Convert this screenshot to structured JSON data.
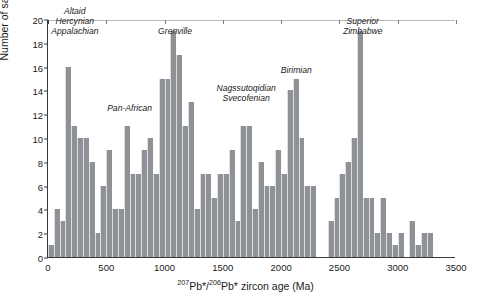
{
  "chart_data": {
    "type": "bar",
    "title": "",
    "xlabel": "207Pb*/206Pb* zircon age (Ma)",
    "ylabel": "Number of samples",
    "xlim": [
      0,
      3500
    ],
    "ylim": [
      0,
      20
    ],
    "xticks": [
      0,
      500,
      1000,
      1500,
      2000,
      2500,
      3000,
      3500
    ],
    "yticks": [
      0,
      2,
      4,
      6,
      8,
      10,
      12,
      14,
      16,
      18,
      20
    ],
    "bin_width": 50,
    "grid": false,
    "legend": null,
    "bar_color": "#8e9195",
    "categories": [
      "0-50",
      "50-100",
      "100-150",
      "150-200",
      "200-250",
      "250-300",
      "300-350",
      "350-400",
      "400-450",
      "450-500",
      "500-550",
      "550-600",
      "600-650",
      "650-700",
      "700-750",
      "750-800",
      "800-850",
      "850-900",
      "900-950",
      "950-1000",
      "1000-1050",
      "1050-1100",
      "1100-1150",
      "1150-1200",
      "1200-1250",
      "1250-1300",
      "1300-1350",
      "1350-1400",
      "1400-1450",
      "1450-1500",
      "1500-1550",
      "1550-1600",
      "1600-1650",
      "1650-1700",
      "1700-1750",
      "1750-1800",
      "1800-1850",
      "1850-1900",
      "1900-1950",
      "1950-2000",
      "2000-2050",
      "2050-2100",
      "2100-2150",
      "2150-2200",
      "2200-2250",
      "2250-2300",
      "2300-2350",
      "2350-2400",
      "2400-2450",
      "2450-2500",
      "2500-2550",
      "2550-2600",
      "2600-2650",
      "2650-2700",
      "2700-2750",
      "2750-2800",
      "2800-2850",
      "2850-2900",
      "2900-2950",
      "2950-3000",
      "3000-3050",
      "3050-3100",
      "3100-3150",
      "3150-3200",
      "3200-3250",
      "3250-3300",
      "3300-3350",
      "3350-3400",
      "3400-3450",
      "3450-3500"
    ],
    "values": [
      1,
      4,
      3,
      16,
      11,
      10,
      10,
      8,
      2,
      6,
      9,
      4,
      4,
      11,
      7,
      7,
      9,
      10,
      7,
      15,
      15,
      19,
      17,
      11,
      13,
      4,
      7,
      7,
      5,
      7,
      7,
      9,
      3,
      11,
      11,
      4,
      8,
      6,
      6,
      9,
      7,
      14,
      15,
      10,
      6,
      6,
      0,
      0,
      3,
      5,
      7,
      8,
      10,
      19,
      5,
      5,
      2,
      5,
      2,
      1,
      2,
      0,
      3,
      1,
      2,
      2,
      0,
      0,
      0,
      0
    ],
    "x_centers": [
      25,
      75,
      125,
      175,
      225,
      275,
      325,
      375,
      425,
      475,
      525,
      575,
      625,
      675,
      725,
      775,
      825,
      875,
      925,
      975,
      1025,
      1075,
      1125,
      1175,
      1225,
      1275,
      1325,
      1375,
      1425,
      1475,
      1525,
      1575,
      1625,
      1675,
      1725,
      1775,
      1825,
      1875,
      1925,
      1975,
      2025,
      2075,
      2125,
      2175,
      2225,
      2275,
      2325,
      2375,
      2425,
      2475,
      2525,
      2575,
      2625,
      2675,
      2725,
      2775,
      2825,
      2875,
      2925,
      2975,
      3025,
      3075,
      3125,
      3175,
      3225,
      3275,
      3325,
      3375,
      3425,
      3475
    ],
    "annotations": [
      {
        "text": "Altaid\nHercynian\nAppalachian",
        "age": 230,
        "count": 18.6
      },
      {
        "text": "Pan-African",
        "age": 700,
        "count": 12.2
      },
      {
        "text": "Grenville",
        "age": 1090,
        "count": 18.6
      },
      {
        "text": "Nagssutoqidian\nSvecofenian",
        "age": 1700,
        "count": 13.0
      },
      {
        "text": "Birimian",
        "age": 2130,
        "count": 15.4
      },
      {
        "text": "Superior\nZimbabwe",
        "age": 2700,
        "count": 18.6
      }
    ]
  },
  "axis": {
    "y_title": "Number of samples",
    "x_title_pre": "",
    "x_iso1_sup": "207",
    "x_iso1": "Pb*/",
    "x_iso2_sup": "206",
    "x_iso2": "Pb* zircon age (Ma)"
  },
  "caption": {
    "fragment": "207Pb*/206Pb*"
  }
}
